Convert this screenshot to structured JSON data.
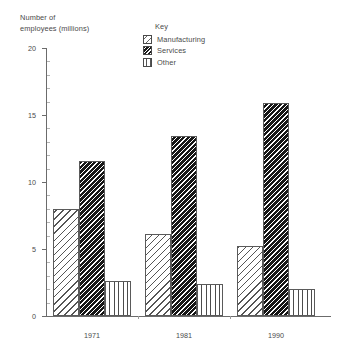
{
  "chart_data": {
    "type": "bar",
    "title": "",
    "ylabel": "Number of employees (millions)",
    "xlabel": "",
    "categories": [
      "1971",
      "1981",
      "1990"
    ],
    "series": [
      {
        "name": "Manufacturing",
        "values": [
          8.0,
          6.1,
          5.2
        ],
        "pattern": "diagonal-hatch-light"
      },
      {
        "name": "Services",
        "values": [
          11.6,
          13.4,
          15.9
        ],
        "pattern": "diagonal-hatch-dense-dark"
      },
      {
        "name": "Other",
        "values": [
          2.6,
          2.4,
          2.0
        ],
        "pattern": "vertical-stripes"
      }
    ],
    "ylim": [
      0,
      20
    ],
    "yticks": [
      0,
      5,
      10,
      15,
      20
    ],
    "ytick_labels": [
      "0",
      "5",
      "10",
      "15",
      "20"
    ],
    "grid": false,
    "legend_position": "top-center"
  },
  "axis": {
    "y_title_line1": "Number of",
    "y_title_line2": "employees (millions)"
  },
  "legend": {
    "title": "Key",
    "items": [
      {
        "label": "Manufacturing"
      },
      {
        "label": "Services"
      },
      {
        "label": "Other"
      }
    ]
  },
  "colors": {
    "axis": "#6b6b6b",
    "text": "#4a4a4a",
    "bar_outline": "#5a5a5a",
    "background": "#ffffff"
  }
}
